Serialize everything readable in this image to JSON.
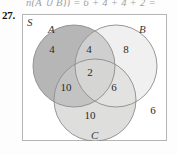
{
  "exercise": {
    "number": "27.",
    "top_fragment": "n(A ∪ B)) = 6 + 4 + 4 + 2 ="
  },
  "diagram": {
    "type": "venn-3-circle",
    "universe_label": "S",
    "sets": [
      {
        "id": "A",
        "label": "A",
        "fill": "#b4b4b4",
        "stroke": "#8f8f8f"
      },
      {
        "id": "B",
        "label": "B",
        "fill": "#efefef",
        "stroke": "#8f8f8f"
      },
      {
        "id": "C",
        "label": "C",
        "fill": "#dcdcdc",
        "stroke": "#8f8f8f"
      }
    ],
    "regions": {
      "a_only": "4",
      "a_and_b": "4",
      "b_only": "8",
      "a_and_c": "10",
      "a_and_b_and_c": "2",
      "b_and_c": "6",
      "c_only": "10",
      "outside": "6"
    },
    "colors": {
      "box_border": "#b4b4b4",
      "text": "#2a2a2a",
      "label_text": "#3a3a3a"
    }
  }
}
